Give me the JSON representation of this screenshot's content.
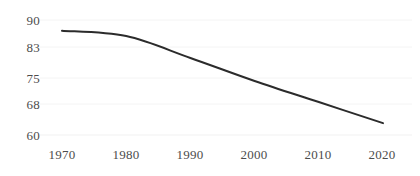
{
  "chart_data": {
    "type": "line",
    "title": "",
    "subtitle": "",
    "xlabel": "",
    "ylabel": "",
    "x": [
      1970,
      1980,
      1990,
      2000,
      2010,
      2020
    ],
    "categories": [
      "1970",
      "1980",
      "1990",
      "2000",
      "2010",
      "2020"
    ],
    "values": [
      87.2,
      85.8,
      80.1,
      74.1,
      68.6,
      63.1
    ],
    "series": [
      {
        "name": "",
        "values": [
          87.2,
          85.8,
          80.1,
          74.1,
          68.6,
          63.1
        ]
      }
    ],
    "xlim": [
      1970,
      2020
    ],
    "ylim": [
      60,
      90
    ],
    "yticks": [
      60,
      68,
      75,
      83,
      90
    ],
    "ytick_labels": [
      "60",
      "68",
      "75",
      "83",
      "90"
    ],
    "xtick_labels": [
      "1970",
      "1980",
      "1990",
      "2000",
      "2010",
      "2020"
    ],
    "grid": true,
    "grid_axis": "y",
    "legend": false,
    "legend_position": "none",
    "annotations": [],
    "line_color": "#2b2b2b",
    "grid_color": "#f4f4f4",
    "tick_label_color": "#4c4c4c",
    "background_color": "#ffffff"
  },
  "axes": {
    "y_ticks": [
      {
        "label": "90",
        "value": 90
      },
      {
        "label": "83",
        "value": 83
      },
      {
        "label": "75",
        "value": 75
      },
      {
        "label": "68",
        "value": 68
      },
      {
        "label": "60",
        "value": 60
      }
    ],
    "x_ticks": [
      {
        "label": "1970",
        "value": 1970
      },
      {
        "label": "1980",
        "value": 1980
      },
      {
        "label": "1990",
        "value": 1990
      },
      {
        "label": "2000",
        "value": 2000
      },
      {
        "label": "2010",
        "value": 2010
      },
      {
        "label": "2020",
        "value": 2020
      }
    ]
  }
}
